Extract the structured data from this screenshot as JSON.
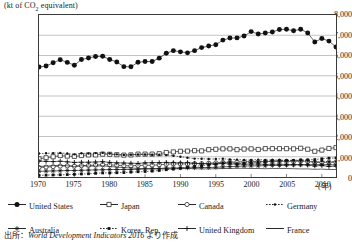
{
  "unit_title": "(kt of CO",
  "unit_title_sub": "2",
  "unit_title_tail": " equivalent)",
  "xaxis_label": "(年)",
  "source_prefix": "出所：",
  "source_title": "World Development Indicators 2016",
  "source_suffix": " より作成",
  "legend": {
    "rows": [
      [
        {
          "label": "United States",
          "symbol": "line-filled-circle",
          "color": "#111111"
        },
        {
          "label": "Japan",
          "symbol": "line-open-square",
          "color": "#111111"
        },
        {
          "label": "Canada",
          "symbol": "line-open-circle",
          "color": "#111111"
        },
        {
          "label": "Germany",
          "symbol": "dotted-small-marker",
          "color": "#111111"
        }
      ],
      [
        {
          "label": "Australia",
          "symbol": "line-star",
          "color": "#111111"
        },
        {
          "label": "Korea, Rep.",
          "symbol": "dotted-square-marker",
          "color": "#111111"
        },
        {
          "label": "United Kingdom",
          "symbol": "line-plus",
          "color": "#111111"
        },
        {
          "label": "France",
          "symbol": "plain-line",
          "color": "#111111"
        }
      ]
    ]
  },
  "chart_data": {
    "type": "line",
    "title": "",
    "xlabel": "(年)",
    "ylabel": "(kt of CO2 equivalent)",
    "xlim": [
      1970,
      2012
    ],
    "ylim": [
      0,
      8000
    ],
    "ytick_labels": [
      "0",
      "1,000",
      "2,000",
      "3,000",
      "4,000",
      "5,000",
      "6,000",
      "7,000",
      "8,000"
    ],
    "ytick_values": [
      0,
      1000,
      2000,
      3000,
      4000,
      5000,
      6000,
      7000,
      8000
    ],
    "xtick_labels": [
      "1970",
      "1975",
      "1980",
      "1985",
      "1990",
      "1995",
      "2000",
      "2005",
      "2010"
    ],
    "xtick_values": [
      1970,
      1975,
      1980,
      1985,
      1990,
      1995,
      2000,
      2005,
      2010
    ],
    "grid": "horizontal",
    "legend_position": "below",
    "x": [
      1970,
      1971,
      1972,
      1973,
      1974,
      1975,
      1976,
      1977,
      1978,
      1979,
      1980,
      1981,
      1982,
      1983,
      1984,
      1985,
      1986,
      1987,
      1988,
      1989,
      1990,
      1991,
      1992,
      1993,
      1994,
      1995,
      1996,
      1997,
      1998,
      1999,
      2000,
      2001,
      2002,
      2003,
      2004,
      2005,
      2006,
      2007,
      2008,
      2009,
      2010,
      2011,
      2012
    ],
    "series": [
      {
        "name": "United States",
        "marker": "filled-circle",
        "values": [
          5430,
          5480,
          5640,
          5790,
          5660,
          5520,
          5800,
          5880,
          5950,
          5960,
          5800,
          5680,
          5450,
          5440,
          5670,
          5700,
          5700,
          5870,
          6110,
          6240,
          6180,
          6130,
          6240,
          6390,
          6470,
          6530,
          6760,
          6860,
          6870,
          6960,
          7180,
          7060,
          7110,
          7160,
          7280,
          7300,
          7220,
          7300,
          7110,
          6670,
          6840,
          6710,
          6420
        ]
      },
      {
        "name": "Japan",
        "marker": "open-square",
        "values": [
          900,
          950,
          1000,
          1060,
          1030,
          1020,
          1060,
          1090,
          1090,
          1130,
          1120,
          1100,
          1080,
          1090,
          1130,
          1130,
          1130,
          1150,
          1210,
          1240,
          1270,
          1280,
          1300,
          1290,
          1350,
          1370,
          1390,
          1390,
          1350,
          1380,
          1390,
          1360,
          1400,
          1400,
          1400,
          1400,
          1390,
          1420,
          1370,
          1270,
          1330,
          1410,
          1450
        ]
      },
      {
        "name": "Canada",
        "marker": "open-circle",
        "values": [
          470,
          490,
          510,
          540,
          550,
          540,
          560,
          570,
          590,
          610,
          600,
          580,
          560,
          550,
          570,
          580,
          580,
          600,
          630,
          650,
          650,
          640,
          660,
          660,
          680,
          700,
          720,
          730,
          740,
          750,
          760,
          750,
          760,
          780,
          780,
          780,
          770,
          790,
          770,
          720,
          720,
          730,
          730
        ]
      },
      {
        "name": "Germany",
        "marker": "small-dot",
        "values": [
          1160,
          1170,
          1180,
          1190,
          1160,
          1120,
          1170,
          1160,
          1180,
          1190,
          1160,
          1120,
          1090,
          1100,
          1110,
          1110,
          1100,
          1100,
          1080,
          1050,
          1000,
          950,
          910,
          900,
          890,
          890,
          900,
          870,
          860,
          840,
          840,
          860,
          840,
          840,
          840,
          820,
          830,
          800,
          800,
          740,
          790,
          750,
          760
        ]
      },
      {
        "name": "Australia",
        "marker": "star",
        "values": [
          280,
          290,
          300,
          310,
          320,
          320,
          330,
          340,
          350,
          360,
          370,
          370,
          370,
          370,
          380,
          400,
          410,
          420,
          440,
          450,
          450,
          450,
          460,
          470,
          470,
          480,
          500,
          510,
          530,
          540,
          550,
          550,
          560,
          570,
          570,
          580,
          590,
          600,
          610,
          610,
          610,
          610,
          600
        ]
      },
      {
        "name": "Korea, Rep.",
        "marker": "square-dot",
        "values": [
          80,
          90,
          100,
          110,
          120,
          130,
          150,
          160,
          180,
          200,
          200,
          210,
          220,
          240,
          260,
          270,
          290,
          320,
          360,
          390,
          430,
          480,
          520,
          560,
          600,
          640,
          690,
          720,
          650,
          690,
          720,
          740,
          760,
          780,
          790,
          810,
          820,
          840,
          850,
          860,
          900,
          930,
          940
        ]
      },
      {
        "name": "United Kingdom",
        "marker": "plus",
        "values": [
          780,
          770,
          760,
          780,
          750,
          720,
          730,
          730,
          740,
          760,
          720,
          700,
          690,
          680,
          670,
          700,
          710,
          710,
          720,
          710,
          700,
          710,
          680,
          660,
          650,
          640,
          670,
          640,
          640,
          630,
          640,
          640,
          620,
          630,
          630,
          620,
          620,
          610,
          590,
          540,
          570,
          520,
          540
        ]
      },
      {
        "name": "France",
        "marker": "none",
        "values": [
          520,
          540,
          560,
          580,
          550,
          520,
          550,
          540,
          540,
          550,
          520,
          490,
          460,
          450,
          420,
          410,
          400,
          400,
          410,
          410,
          410,
          420,
          410,
          400,
          400,
          410,
          420,
          420,
          430,
          430,
          420,
          420,
          410,
          420,
          420,
          420,
          410,
          400,
          400,
          380,
          390,
          370,
          370
        ]
      }
    ]
  }
}
